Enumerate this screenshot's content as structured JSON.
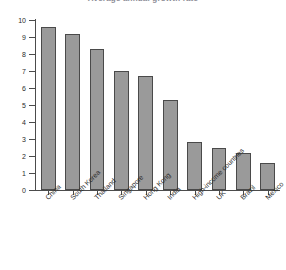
{
  "chart_data": {
    "type": "bar",
    "title": "Average annual growth rate",
    "xlabel": "",
    "ylabel": "Average annual growth rate (%)",
    "ylim": [
      0,
      10
    ],
    "yticks": [
      0,
      1,
      2,
      3,
      4,
      5,
      6,
      7,
      8,
      9,
      10
    ],
    "ytick_labels": [
      "0",
      "1",
      "2",
      "3",
      "4",
      "5",
      "6",
      "7",
      "8",
      "9",
      "10"
    ],
    "grid": false,
    "legend": null,
    "bar_color": "#9a9a9a",
    "bar_edge_color": "#4a4a4a",
    "categories": [
      "China",
      "South Korea",
      "Thailand",
      "Singapore",
      "Hong Kong",
      "India",
      "High-income countries",
      "UK",
      "Brazil",
      "Mexico"
    ],
    "values": [
      9.6,
      9.2,
      8.3,
      7.0,
      6.7,
      5.3,
      2.8,
      2.5,
      2.2,
      1.6
    ]
  }
}
